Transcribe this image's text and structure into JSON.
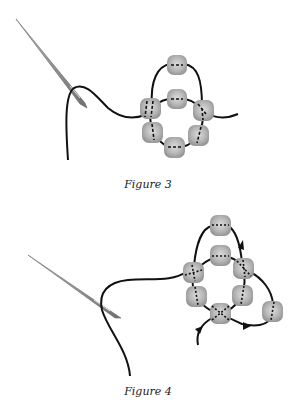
{
  "figures": [
    {
      "id": "figure-3",
      "caption": "Figure 3",
      "bead_count": 7,
      "arrows": 0
    },
    {
      "id": "figure-4",
      "caption": "Figure 4",
      "bead_count": 8,
      "arrows": 3
    }
  ],
  "colors": {
    "thread": "#111111",
    "bead_fill": "#a8a8a8",
    "bead_highlight": "#d9d9d9",
    "needle": "#8c8c8c",
    "background": "#ffffff"
  }
}
